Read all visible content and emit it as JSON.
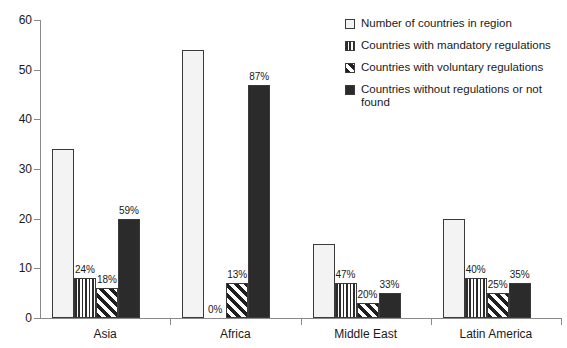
{
  "chart_data": {
    "type": "bar",
    "title": "",
    "subtitle": "",
    "xlabel": "",
    "ylabel": "",
    "ylim": [
      0,
      60
    ],
    "ytick_values": [
      0,
      10,
      20,
      30,
      40,
      50,
      60
    ],
    "ytick_labels": [
      "0",
      "10",
      "20",
      "30",
      "40",
      "50",
      "60"
    ],
    "grid": false,
    "legend_position": "right-top",
    "categories": [
      "Asia",
      "Africa",
      "Middle East",
      "Latin America"
    ],
    "series": [
      {
        "name": "Number of countries in region",
        "pattern": "dots",
        "values": [
          34,
          54,
          15,
          20
        ],
        "labels": [
          "",
          "",
          "",
          ""
        ]
      },
      {
        "name": "Countries with mandatory regulations",
        "pattern": "vertical-lines",
        "values": [
          8,
          0,
          7,
          8
        ],
        "labels": [
          "24%",
          "0%",
          "47%",
          "40%"
        ]
      },
      {
        "name": "Countries with voluntary regulations",
        "pattern": "diagonal-stripes",
        "values": [
          6,
          7,
          3,
          5
        ],
        "labels": [
          "18%",
          "13%",
          "20%",
          "25%"
        ]
      },
      {
        "name": "Countries without regulations or not found",
        "pattern": "solid-dark",
        "values": [
          20,
          47,
          5,
          7
        ],
        "labels": [
          "59%",
          "87%",
          "33%",
          "35%"
        ]
      }
    ]
  },
  "legend": {
    "items": [
      {
        "label": "Number of countries in region",
        "pattern": "dots"
      },
      {
        "label": "Countries with mandatory regulations",
        "pattern": "vertical-lines"
      },
      {
        "label": "Countries with voluntary regulations",
        "pattern": "diagonal-stripes"
      },
      {
        "label": "Countries without regulations or not found",
        "pattern": "solid-dark"
      }
    ]
  },
  "colors": {
    "axis": "#8a8a8a",
    "text": "#1a1a1a",
    "solid_fill": "#2b2b2b",
    "dot_fill": "#f3f3f3",
    "background": "#ffffff"
  }
}
